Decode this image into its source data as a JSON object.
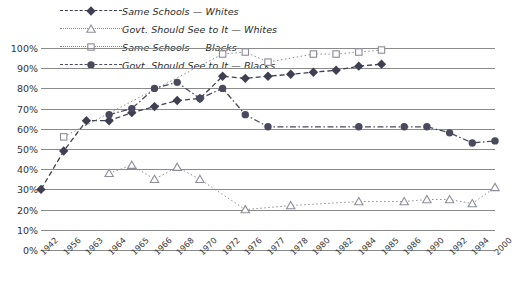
{
  "chart_data": {
    "type": "line",
    "title": "",
    "xlabel": "",
    "ylabel": "",
    "ylim": [
      0,
      100
    ],
    "ytick_labels": [
      "0%",
      "10%",
      "20%",
      "30%",
      "40%",
      "50%",
      "60%",
      "70%",
      "80%",
      "90%",
      "100%"
    ],
    "ytick_values": [
      0,
      10,
      20,
      30,
      40,
      50,
      60,
      70,
      80,
      90,
      100
    ],
    "grid": "horizontal",
    "legend_position": "top-left",
    "categories": [
      "1942",
      "1956",
      "1963",
      "1964",
      "1965",
      "1966",
      "1968",
      "1970",
      "1972",
      "1976",
      "1977",
      "1978",
      "1980",
      "1982",
      "1984",
      "1985",
      "1986",
      "1990",
      "1992",
      "1994",
      "2000"
    ],
    "series": [
      {
        "name": "Same Schools — Whites",
        "marker": "diamond",
        "line_style": "dashed",
        "color": "#3f3f52",
        "points": [
          {
            "x": "1942",
            "y": 30
          },
          {
            "x": "1956",
            "y": 49
          },
          {
            "x": "1963",
            "y": 64
          },
          {
            "x": "1964",
            "y": 64
          },
          {
            "x": "1965",
            "y": 68
          },
          {
            "x": "1966",
            "y": 71
          },
          {
            "x": "1968",
            "y": 74
          },
          {
            "x": "1970",
            "y": 75
          },
          {
            "x": "1972",
            "y": 86
          },
          {
            "x": "1976",
            "y": 85
          },
          {
            "x": "1977",
            "y": 86
          },
          {
            "x": "1978",
            "y": 87
          },
          {
            "x": "1980",
            "y": 88
          },
          {
            "x": "1982",
            "y": 89
          },
          {
            "x": "1984",
            "y": 91
          },
          {
            "x": "1985",
            "y": 92
          }
        ]
      },
      {
        "name": "Govt. Should See to It — Whites",
        "marker": "triangle",
        "line_style": "dotted",
        "color": "#8d8d9c",
        "points": [
          {
            "x": "1964",
            "y": 38
          },
          {
            "x": "1965",
            "y": 42
          },
          {
            "x": "1966",
            "y": 35
          },
          {
            "x": "1968",
            "y": 41
          },
          {
            "x": "1970",
            "y": 35
          },
          {
            "x": "1976",
            "y": 20
          },
          {
            "x": "1978",
            "y": 22
          },
          {
            "x": "1984",
            "y": 24
          },
          {
            "x": "1986",
            "y": 24
          },
          {
            "x": "1990",
            "y": 25
          },
          {
            "x": "1992",
            "y": 25
          },
          {
            "x": "1994",
            "y": 23
          },
          {
            "x": "2000",
            "y": 31
          }
        ]
      },
      {
        "name": "Same Schools — Blacks",
        "marker": "square",
        "line_style": "dotted",
        "color": "#8b8b99",
        "points": [
          {
            "x": "1956",
            "y": 56
          },
          {
            "x": "1972",
            "y": 97
          },
          {
            "x": "1976",
            "y": 98
          },
          {
            "x": "1977",
            "y": 93
          },
          {
            "x": "1980",
            "y": 97
          },
          {
            "x": "1982",
            "y": 97
          },
          {
            "x": "1984",
            "y": 98
          },
          {
            "x": "1985",
            "y": 99
          }
        ]
      },
      {
        "name": "Govt. Should See to It — Blacks",
        "marker": "circle",
        "line_style": "dash-dot",
        "color": "#4a4a5e",
        "points": [
          {
            "x": "1964",
            "y": 67
          },
          {
            "x": "1965",
            "y": 70
          },
          {
            "x": "1966",
            "y": 80
          },
          {
            "x": "1968",
            "y": 83
          },
          {
            "x": "1970",
            "y": 75
          },
          {
            "x": "1972",
            "y": 80
          },
          {
            "x": "1976",
            "y": 67
          },
          {
            "x": "1977",
            "y": 61
          },
          {
            "x": "1984",
            "y": 61
          },
          {
            "x": "1986",
            "y": 61
          },
          {
            "x": "1990",
            "y": 61
          },
          {
            "x": "1992",
            "y": 58
          },
          {
            "x": "1994",
            "y": 53
          },
          {
            "x": "2000",
            "y": 54
          }
        ]
      }
    ],
    "legend": [
      {
        "label": "Same Schools — Whites",
        "marker": "diamond",
        "line_style": "dashed",
        "color": "#3f3f52"
      },
      {
        "label": "Govt. Should See to It — Whites",
        "marker": "triangle",
        "line_style": "dotted",
        "color": "#8d8d9c"
      },
      {
        "label": "Same Schools — Blacks",
        "marker": "square",
        "line_style": "dotted",
        "color": "#8b8b99"
      },
      {
        "label": "Govt. Should See to It — Blacks",
        "marker": "circle",
        "line_style": "dash-dot",
        "color": "#4a4a5e"
      }
    ]
  }
}
